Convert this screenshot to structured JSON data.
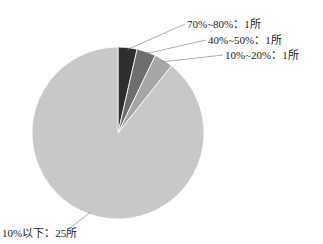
{
  "chart_data": {
    "type": "pie",
    "title": "",
    "categories": [
      "70%~80%",
      "40%~50%",
      "10%~20%",
      "10%以下"
    ],
    "values": [
      1,
      1,
      1,
      25
    ],
    "unit": "所",
    "labels": [
      "70%~80%：1所",
      "40%~50%：1所",
      "10%~20%：1所",
      "10%以下：25所"
    ],
    "colors": [
      "#2e2e2e",
      "#6e6e6e",
      "#a6a6a6",
      "#c8c8c8"
    ],
    "start_angle_deg": 0,
    "direction": "clockwise",
    "legend": "none",
    "data_labels": "outside with leader lines"
  }
}
